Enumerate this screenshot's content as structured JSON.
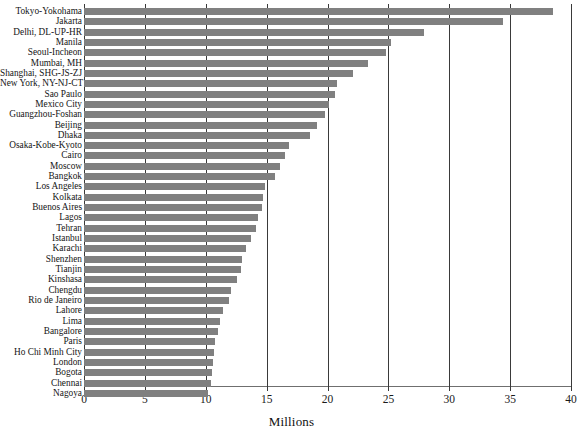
{
  "chart_data": {
    "type": "bar",
    "orientation": "horizontal",
    "title": "",
    "xlabel": "Millions",
    "ylabel": "",
    "xlim": [
      0,
      40
    ],
    "xticks": [
      0,
      5,
      10,
      15,
      20,
      25,
      30,
      35,
      40
    ],
    "xtick_labels": [
      "0",
      "5",
      "10",
      "15",
      "20",
      "25",
      "30",
      "35",
      "40"
    ],
    "grid": "vertical",
    "legend": "none",
    "bar_color": "#808080",
    "gridline_color": "#3a3a3a",
    "categories": [
      "Tokyo-Yokohama",
      "Jakarta",
      "Delhi, DL-UP-HR",
      "Manila",
      "Seoul-Incheon",
      "Mumbai, MH",
      "Shanghai, SHG-JS-ZJ",
      "New York, NY-NJ-CT",
      "Sao Paulo",
      "Mexico City",
      "Guangzhou-Foshan",
      "Beijing",
      "Dhaka",
      "Osaka-Kobe-Kyoto",
      "Cairo",
      "Moscow",
      "Bangkok",
      "Los Angeles",
      "Kolkata",
      "Buenos Aires",
      "Lagos",
      "Tehran",
      "Istanbul",
      "Karachi",
      "Shenzhen",
      "Tianjin",
      "Kinshasa",
      "Chengdu",
      "Rio de Janeiro",
      "Lahore",
      "Lima",
      "Bangalore",
      "Paris",
      "Ho Chi Minh City",
      "London",
      "Bogota",
      "Chennai",
      "Nagoya"
    ],
    "values": [
      38.5,
      34.4,
      27.9,
      25.2,
      24.8,
      23.3,
      22.1,
      20.8,
      20.6,
      20.1,
      19.8,
      19.1,
      18.6,
      16.8,
      16.5,
      16.1,
      15.7,
      14.9,
      14.7,
      14.6,
      14.3,
      14.1,
      13.7,
      13.3,
      13.0,
      12.9,
      12.6,
      12.1,
      11.9,
      11.4,
      11.2,
      11.0,
      10.8,
      10.7,
      10.6,
      10.5,
      10.4,
      10.2
    ]
  },
  "axis": {
    "x_title": "Millions"
  }
}
